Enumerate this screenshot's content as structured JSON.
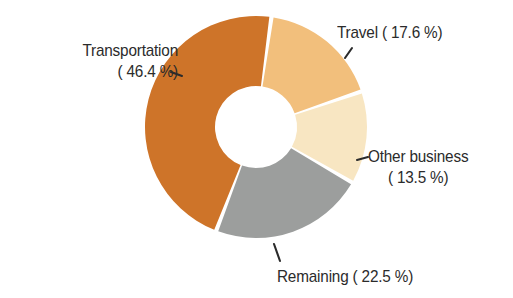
{
  "chart_data": {
    "type": "pie",
    "variant": "donut",
    "title": "",
    "subtitle": "",
    "xlabel": "",
    "ylabel": "",
    "units": "percent",
    "total": 100.0,
    "legend_position": "none",
    "labels_position": "outside-with-leader-lines",
    "grid": false,
    "background_color": "#ffffff",
    "text_color": "#2b2b2b",
    "categories": [
      "Travel",
      "Other business",
      "Remaining",
      "Transportation"
    ],
    "values": [
      17.6,
      13.5,
      22.5,
      46.4
    ],
    "colors": [
      "#f2bf7c",
      "#f8e6c2",
      "#9c9e9d",
      "#ce7429"
    ],
    "slices": [
      {
        "name": "Travel",
        "label": "Travel ( 17.6 %)",
        "value": 17.6,
        "value_text": "17.6 %",
        "color": "#f2bf7c",
        "start_angle": 8,
        "end_angle": 71.4
      },
      {
        "name": "Other business",
        "label": "Other business ( 13.5 %)",
        "value": 13.5,
        "value_text": "13.5 %",
        "color": "#f8e6c2",
        "start_angle": 71.4,
        "end_angle": 120.0
      },
      {
        "name": "Remaining",
        "label": "Remaining ( 22.5 %)",
        "value": 22.5,
        "value_text": "22.5 %",
        "color": "#9c9e9d",
        "start_angle": 120.0,
        "end_angle": 201.0
      },
      {
        "name": "Transportation",
        "label": "Transportation ( 46.4 %)",
        "value": 46.4,
        "value_text": "46.4 %",
        "color": "#ce7429",
        "start_angle": 201.0,
        "end_angle": 368.0
      }
    ],
    "geometry": {
      "center_x": 256,
      "center_y": 127,
      "outer_radius": 111,
      "inner_radius": 41,
      "gap_degrees": 2.2
    }
  },
  "labels": {
    "transportation": {
      "line1": "Transportation",
      "line2": "( 46.4 %)"
    },
    "travel": {
      "line1": "Travel ( 17.6 %)"
    },
    "other_business": {
      "line1": "Other business",
      "line2": "( 13.5 %)"
    },
    "remaining": {
      "line1": "Remaining ( 22.5 %)"
    }
  }
}
